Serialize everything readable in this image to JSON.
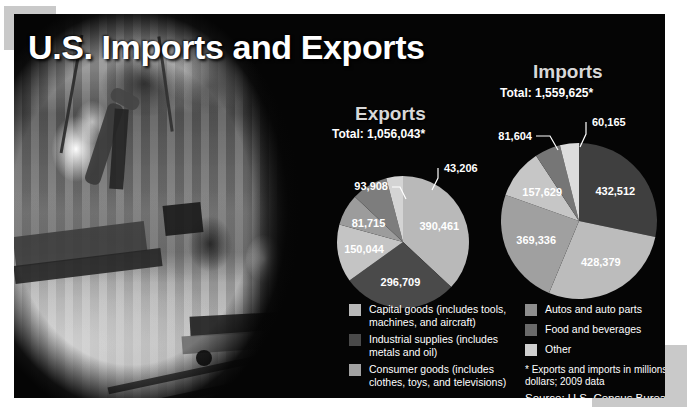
{
  "title": "U.S. Imports and Exports",
  "source": "Source: U.S. Census Bureau",
  "footnote": "* Exports and imports in millions of dollars; 2009 data",
  "photo": {
    "alt": "Black and white photograph of a film crew on a camera dolly riding a track while a stuntman performs a mid-air flip on a city plaza"
  },
  "exports": {
    "heading": "Exports",
    "total_label": "Total: 1,056,043*",
    "legend": [
      {
        "label": "Capital goods (includes tools, machines, and aircraft)",
        "color": "#b9b9b9"
      },
      {
        "label": "Industrial supplies (includes metals and oil)",
        "color": "#4a4a4a"
      },
      {
        "label": "Consumer goods (includes clothes, toys, and televisions)",
        "color": "#a2a2a2"
      }
    ]
  },
  "imports": {
    "heading": "Imports",
    "total_label": "Total: 1,559,625*",
    "legend": [
      {
        "label": "Autos and auto parts",
        "color": "#8e8e8e"
      },
      {
        "label": "Food and beverages",
        "color": "#6a6a6a"
      },
      {
        "label": "Other",
        "color": "#cfcfcf"
      }
    ]
  },
  "chart_data": [
    {
      "type": "pie",
      "title": "Exports",
      "subtitle": "Total: 1,056,043*",
      "unit": "millions of dollars",
      "year": "2009",
      "total": 1056043,
      "labels": [
        "390,461",
        "296,709",
        "150,044",
        "81,715",
        "93,908",
        "43,206"
      ],
      "values": [
        390461,
        296709,
        150044,
        81715,
        93908,
        43206
      ],
      "categories": [
        "Capital goods (includes tools, machines, and aircraft)",
        "Industrial supplies (includes metals and oil)",
        "Consumer goods (includes clothes, toys, and televisions)",
        "Autos and auto parts",
        "Food and beverages",
        "Other"
      ],
      "colors": [
        "#b9b9b9",
        "#4a4a4a",
        "#c4c4c4",
        "#9c9c9c",
        "#7d7d7d",
        "#d4d4d4"
      ],
      "label_placement": [
        "inside",
        "inside",
        "inside",
        "inside",
        "outside",
        "outside"
      ],
      "legend_position": "bottom-left"
    },
    {
      "type": "pie",
      "title": "Imports",
      "subtitle": "Total: 1,559,625*",
      "unit": "millions of dollars",
      "year": "2009",
      "total": 1559625,
      "labels": [
        "432,512",
        "428,379",
        "369,336",
        "157,629",
        "81,604",
        "60,165"
      ],
      "values": [
        432512,
        428379,
        369336,
        157629,
        81604,
        60165
      ],
      "categories": [
        "Industrial supplies (includes metals and oil)",
        "Capital goods (includes tools, machines, and aircraft)",
        "Consumer goods (includes clothes, toys, and televisions)",
        "Autos and auto parts",
        "Food and beverages",
        "Other"
      ],
      "colors": [
        "#3f3f3f",
        "#bcbcbc",
        "#a0a0a0",
        "#c6c6c6",
        "#767676",
        "#dcdcdc"
      ],
      "label_placement": [
        "inside",
        "inside",
        "inside",
        "inside",
        "outside",
        "outside"
      ],
      "legend_position": "bottom-right"
    }
  ]
}
